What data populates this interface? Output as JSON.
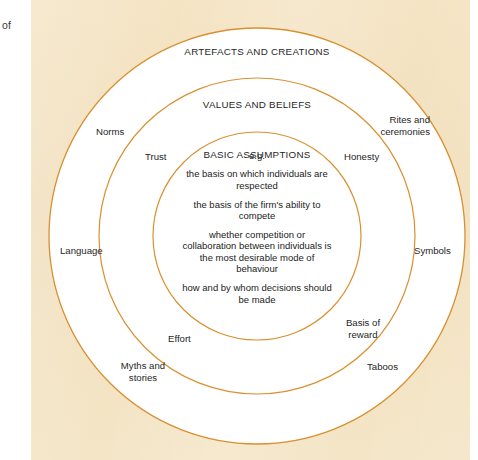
{
  "margin": {
    "note": "of"
  },
  "figure": {
    "kind": "concentric-rings-diagram",
    "background_color": "#f4e3c1",
    "ring_stroke_color": "#d9902f",
    "ring_fill_color": "#ffffff",
    "text_color": "#262626"
  },
  "rings": [
    {
      "id": "outer",
      "title": "ARTEFACTS AND CREATIONS",
      "labels": [
        "Norms",
        "Rites and ceremonies",
        "Language",
        "Symbols",
        "Myths and stories",
        "Taboos"
      ]
    },
    {
      "id": "middle",
      "title": "VALUES AND BELIEFS",
      "labels": [
        "Trust",
        "Honesty",
        "Effort",
        "Basis of reward"
      ]
    },
    {
      "id": "inner",
      "title": "BASIC ASSUMPTIONS",
      "labels": []
    }
  ],
  "core": {
    "title": "BASIC ASSUMPTIONS",
    "eg": "e.g.",
    "items": [
      "the basis on which individuals are respected",
      "the basis of the firm's ability to compete",
      "whether competition or collaboration between individuals is the most desirable mode of behaviour",
      "how and by whom decisions should be made"
    ]
  },
  "outer_labels": {
    "norms": "Norms",
    "rites_and_ceremonies": "Rites and\nceremonies",
    "language": "Language",
    "symbols": "Symbols",
    "myths_and_stories": "Myths and\nstories",
    "taboos": "Taboos"
  },
  "middle_labels": {
    "trust": "Trust",
    "honesty": "Honesty",
    "effort": "Effort",
    "basis_of_reward": "Basis of\nreward"
  },
  "geometry": {
    "center_x": 257,
    "center_y": 236,
    "outer_radius": 208,
    "middle_radius": 158,
    "inner_radius": 104
  }
}
